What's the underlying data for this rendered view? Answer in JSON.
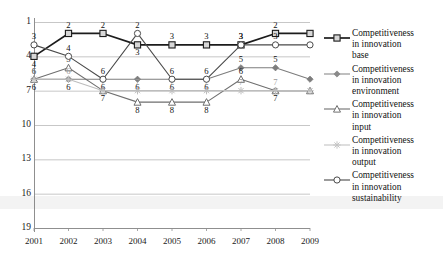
{
  "chart_data": {
    "type": "line",
    "title": "",
    "xlabel": "",
    "ylabel": "",
    "x": [
      "2001",
      "2002",
      "2003",
      "2004",
      "2005",
      "2006",
      "2007",
      "2008",
      "2009"
    ],
    "categories": [
      "2001",
      "2002",
      "2003",
      "2004",
      "2005",
      "2006",
      "2007",
      "2008",
      "2009"
    ],
    "ylim": [
      1,
      19
    ],
    "y_inverted": true,
    "yticks": [
      "1",
      "4",
      "7",
      "10",
      "13",
      "16",
      "19"
    ],
    "ytick_values": [
      1,
      4,
      7,
      10,
      13,
      16,
      19
    ],
    "grid": "horizontal",
    "legend_position": "right",
    "series": [
      {
        "name": "Competitiveness in innovation base",
        "marker": "square",
        "color": "#1c1c1c",
        "values": [
          4,
          2,
          2,
          3,
          3,
          3,
          3,
          2,
          2
        ],
        "labels": [
          "4",
          "2",
          "2",
          "3",
          "3",
          "3",
          "3",
          "2",
          "2"
        ]
      },
      {
        "name": "Competitiveness in innovation environment",
        "marker": "diamond",
        "color": "#7d7d7d",
        "values": [
          6,
          6,
          6,
          6,
          6,
          6,
          5,
          5,
          6
        ],
        "labels": [
          "6",
          "6",
          "6",
          "6",
          "6",
          "6",
          "5",
          "5",
          "6"
        ]
      },
      {
        "name": "Competitiveness in innovation input",
        "marker": "triangle",
        "color": "#6f6f6f",
        "values": [
          6,
          5,
          7,
          8,
          8,
          8,
          6,
          7,
          7
        ],
        "labels": [
          "6",
          "5",
          "7",
          "8",
          "8",
          "8",
          "6",
          "7",
          "7"
        ]
      },
      {
        "name": "Competitiveness in innovation output",
        "marker": "star",
        "color": "#bdbdbd",
        "values": [
          6,
          6,
          7,
          7,
          7,
          7,
          7,
          7,
          7
        ],
        "labels": [
          "6",
          "6",
          "7",
          "7",
          "7",
          "7",
          "7",
          "7",
          "7"
        ]
      },
      {
        "name": "Competitiveness in innovation sustainability",
        "marker": "circle",
        "color": "#4a4a4a",
        "values": [
          3,
          4,
          6,
          2,
          6,
          6,
          3,
          3,
          3
        ],
        "labels": [
          "3",
          "4",
          "6",
          "2",
          "6",
          "6",
          "3",
          "3",
          "3"
        ]
      }
    ]
  },
  "legend": {
    "items": [
      {
        "marker": "square",
        "color": "#1c1c1c",
        "line1": "Competitiveness",
        "line2": "in innovation",
        "line3": "base"
      },
      {
        "marker": "diamond",
        "color": "#8a8a8a",
        "line1": "Competitiveness",
        "line2": "in innovation",
        "line3": "environment"
      },
      {
        "marker": "triangle",
        "color": "#6f6f6f",
        "line1": "Competitiveness",
        "line2": "in innovation",
        "line3": "input"
      },
      {
        "marker": "star",
        "color": "#c4c4c4",
        "line1": "Competitiveness",
        "line2": "in innovation",
        "line3": "output"
      },
      {
        "marker": "circle",
        "color": "#4a4a4a",
        "line1": "Competitiveness",
        "line2": "in innovation",
        "line3": "sustainability"
      }
    ]
  },
  "axes": {
    "y_labels": [
      "1",
      "4",
      "7",
      "10",
      "13",
      "16",
      "19"
    ],
    "x_labels": [
      "2001",
      "2002",
      "2003",
      "2004",
      "2005",
      "2006",
      "2007",
      "2008",
      "2009"
    ]
  },
  "colors": {
    "axis": "#8f8f8f",
    "grid": "#b9b9b9",
    "text": "#151515"
  }
}
